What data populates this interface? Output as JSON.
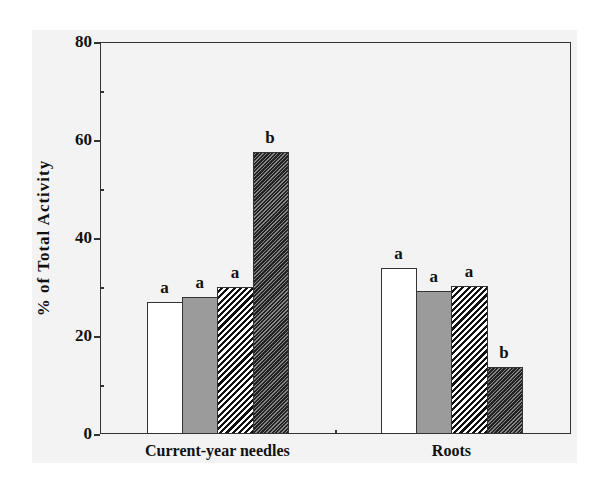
{
  "chart_data": {
    "type": "bar",
    "title": "",
    "xlabel": "",
    "ylabel": "% of Total Activity",
    "ylim": [
      0,
      80
    ],
    "yticks": [
      0,
      20,
      40,
      60,
      80
    ],
    "ytick_labels": [
      "0",
      "20",
      "40",
      "60",
      "80"
    ],
    "grid": false,
    "legend": null,
    "categories": [
      "Current-year needles",
      "Roots"
    ],
    "series": [
      {
        "name": "Treatment 1 (white)",
        "pattern": "open",
        "color": "#ffffff",
        "values": [
          26.9,
          33.9
        ],
        "significance": [
          "a",
          "a"
        ]
      },
      {
        "name": "Treatment 2 (gray)",
        "pattern": "solid-gray",
        "color": "#9b9b9b",
        "values": [
          28.0,
          29.2
        ],
        "significance": [
          "a",
          "a"
        ]
      },
      {
        "name": "Treatment 3 (hatched)",
        "pattern": "diagonal-hatch",
        "color": "#111111",
        "values": [
          30.0,
          30.2
        ],
        "significance": [
          "a",
          "a"
        ]
      },
      {
        "name": "Treatment 4 (dark hatched)",
        "pattern": "dense-dark-hatch",
        "color": "#222222",
        "values": [
          57.6,
          13.7
        ],
        "significance": [
          "b",
          "b"
        ]
      }
    ]
  }
}
